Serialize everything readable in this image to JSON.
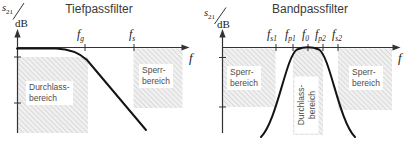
{
  "colors": {
    "background": "#ffffff",
    "axis": "#333333",
    "curve": "#141414",
    "hatch_line": "#c4c4c4",
    "hatch_background": "#f0f0f0",
    "title_text": "#3a3a3a",
    "region_text": "#4d4d4d"
  },
  "panels": [
    {
      "title": "Tiefpassfilter",
      "y_axis_label": {
        "symbol": "s",
        "symbol_sub": "21",
        "unit": "dB"
      },
      "x_axis_label": "f",
      "ticks": [
        {
          "base": "f",
          "sub": "g"
        },
        {
          "base": "f",
          "sub": "s"
        }
      ],
      "regions": [
        {
          "lines": [
            "Durchlass-",
            "bereich"
          ]
        },
        {
          "lines": [
            "Sperr-",
            "bereich"
          ]
        }
      ]
    },
    {
      "title": "Bandpassfilter",
      "y_axis_label": {
        "symbol": "s",
        "symbol_sub": "21",
        "unit": "dB"
      },
      "x_axis_label": "f",
      "ticks": [
        {
          "base": "f",
          "sub": "s1"
        },
        {
          "base": "f",
          "sub": "p1"
        },
        {
          "base": "f",
          "sub": "0"
        },
        {
          "base": "f",
          "sub": "p2"
        },
        {
          "base": "f",
          "sub": "s2"
        }
      ],
      "regions": [
        {
          "lines": [
            "Sperr-",
            "bereich"
          ]
        },
        {
          "lines": [
            "Durchlass-",
            "bereich"
          ]
        },
        {
          "lines": [
            "Sperr-",
            "bereich"
          ]
        }
      ]
    }
  ]
}
